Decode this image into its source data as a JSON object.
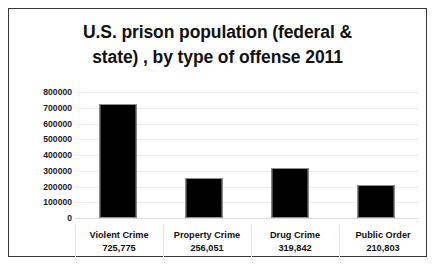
{
  "chart_data": {
    "type": "bar",
    "title": "U.S. prison population (federal & state) , by type of offense 2011",
    "title_lines": [
      "U.S. prison population (federal &",
      "state) , by type of offense 2011"
    ],
    "categories": [
      "Violent Crime",
      "Property Crime",
      "Drug Crime",
      "Public Order"
    ],
    "values": [
      725775,
      256051,
      319842,
      210803
    ],
    "value_labels": [
      "725,775",
      "256,051",
      "319,842",
      "210,803"
    ],
    "series": [
      {
        "name": "U.S. prison population",
        "values": [
          725775,
          256051,
          319842,
          210803
        ]
      }
    ],
    "xlabel": "",
    "ylabel": "",
    "ylim": [
      0,
      800000
    ],
    "y_ticks": [
      800000,
      700000,
      600000,
      500000,
      400000,
      300000,
      200000,
      100000,
      0
    ],
    "y_tick_labels": [
      "800000",
      "700000",
      "600000",
      "500000",
      "400000",
      "300000",
      "200000",
      "100000",
      "0"
    ],
    "grid": true,
    "legend": false,
    "bar_color": "#000000",
    "background_color": "#ffffff",
    "gridline_color": "#ededed",
    "border_color": "#3a3a3a"
  }
}
